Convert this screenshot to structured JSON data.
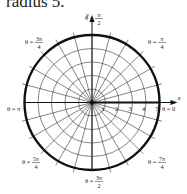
{
  "caption": "radius 5.",
  "diagram": {
    "type": "polar-grid",
    "center": [
      92,
      102.5
    ],
    "pixels_per_unit": 13.5,
    "max_radius": 5,
    "radial_ticks": [
      "1",
      "2",
      "3",
      "4",
      "5"
    ],
    "angular_step_deg": 15,
    "axis_labels": {
      "x": "x",
      "y": "y"
    },
    "angle_labels": [
      {
        "id": "theta-0",
        "num": "0",
        "den": "",
        "text": "θ = 0",
        "x": 162,
        "y": 111
      },
      {
        "id": "theta-pi-4",
        "num": "π",
        "den": "4",
        "text": "θ = π/4",
        "x": 148,
        "y": 44
      },
      {
        "id": "theta-pi-2",
        "num": "π",
        "den": "2",
        "text": "θ = π/2",
        "x": 85,
        "y": 20
      },
      {
        "id": "theta-3pi-4",
        "num": "3π",
        "den": "4",
        "text": "θ = 3π/4",
        "x": 25,
        "y": 44
      },
      {
        "id": "theta-pi",
        "num": "π",
        "den": "",
        "text": "θ = π",
        "x": 7,
        "y": 111
      },
      {
        "id": "theta-5pi-4",
        "num": "5π",
        "den": "4",
        "text": "θ = 5π/4",
        "x": 22,
        "y": 164
      },
      {
        "id": "theta-3pi-2",
        "num": "3π",
        "den": "2",
        "text": "θ = 3π/2",
        "x": 85,
        "y": 183
      },
      {
        "id": "theta-7pi-4",
        "num": "7π",
        "den": "4",
        "text": "θ = 7π/4",
        "x": 148,
        "y": 164
      }
    ],
    "colors": {
      "grid": "#333333",
      "circle": "#111111",
      "text": "#222222"
    }
  }
}
